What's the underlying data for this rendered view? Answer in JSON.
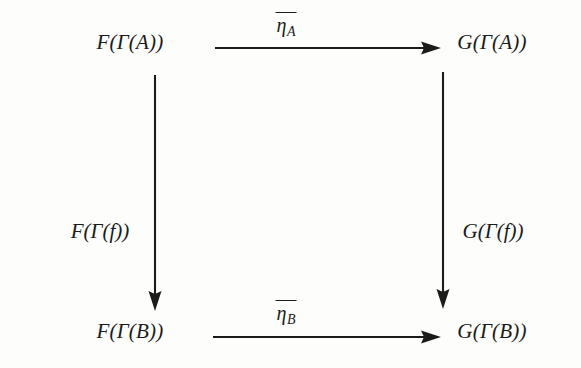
{
  "diagram": {
    "kind": "commutative-square",
    "background_color": "#fdfdfb",
    "ink_color": "#1b1b1b",
    "vertices": [
      {
        "id": "top-left",
        "label": "F(Γ(A))",
        "F": "F",
        "gamma": "Γ",
        "object": "A",
        "x": 130,
        "y": 42
      },
      {
        "id": "top-right",
        "label": "G(Γ(A))",
        "F": "G",
        "gamma": "Γ",
        "object": "A",
        "x": 492,
        "y": 42
      },
      {
        "id": "bottom-left",
        "label": "F(Γ(B))",
        "F": "F",
        "gamma": "Γ",
        "object": "B",
        "x": 130,
        "y": 331
      },
      {
        "id": "bottom-right",
        "label": "G(Γ(B))",
        "F": "G",
        "gamma": "Γ",
        "object": "B",
        "x": 492,
        "y": 331
      }
    ],
    "arrows": [
      {
        "id": "top",
        "orientation": "horizontal",
        "direction": "left-to-right",
        "from": "top-left",
        "to": "top-right",
        "x1": 215,
        "y1": 48,
        "x2": 441,
        "y2": 48,
        "label_text": "η",
        "label_subscript": "A",
        "label_overline": true,
        "label_plain": "η̄_A",
        "label_x": 286,
        "label_y": 12
      },
      {
        "id": "bottom",
        "orientation": "horizontal",
        "direction": "left-to-right",
        "from": "bottom-left",
        "to": "bottom-right",
        "x1": 213,
        "y1": 337,
        "x2": 441,
        "y2": 337,
        "label_text": "η",
        "label_subscript": "B",
        "label_overline": true,
        "label_plain": "η̄_B",
        "label_x": 286,
        "label_y": 300
      },
      {
        "id": "left",
        "orientation": "vertical",
        "direction": "top-to-bottom",
        "from": "top-left",
        "to": "bottom-left",
        "x1": 155,
        "y1": 75,
        "x2": 155,
        "y2": 311,
        "label_plain": "F(Γ(f))",
        "label_F": "F",
        "label_gamma": "Γ",
        "label_morphism": "f",
        "label_x": 100,
        "label_y": 231
      },
      {
        "id": "right",
        "orientation": "vertical",
        "direction": "top-to-bottom",
        "from": "top-right",
        "to": "bottom-right",
        "x1": 443,
        "y1": 72,
        "x2": 443,
        "y2": 309,
        "label_plain": "G(Γ(f))",
        "label_F": "G",
        "label_gamma": "Γ",
        "label_morphism": "f",
        "label_x": 493,
        "label_y": 231
      }
    ]
  }
}
